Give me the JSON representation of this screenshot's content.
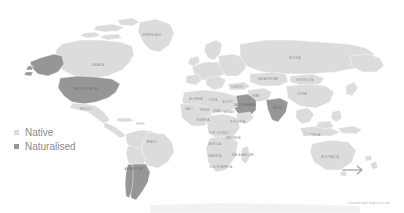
{
  "figure": {
    "type": "choropleth-world-map",
    "background_color": "#ffffff"
  },
  "legend": {
    "items": [
      {
        "label": "Native",
        "color": "#dcdcdc",
        "category": "native"
      },
      {
        "label": "Naturalised",
        "color": "#969696",
        "category": "naturalised"
      }
    ]
  },
  "attribution": {
    "text": "Created with mapchart.net"
  },
  "annotations": [
    {
      "name": "new-zealand-arrow",
      "type": "arrow",
      "direction": "right"
    }
  ],
  "chart_data": {
    "type": "map",
    "title": "",
    "legend_position": "left",
    "categories": [
      "Native",
      "Naturalised"
    ],
    "colors": {
      "Native": "#dcdcdc",
      "Naturalised": "#969696",
      "background": "#ffffff"
    },
    "regions": [
      {
        "name": "Alaska",
        "category": "Naturalised"
      },
      {
        "name": "United States",
        "category": "Naturalised"
      },
      {
        "name": "Canada",
        "category": "Native"
      },
      {
        "name": "Greenland",
        "category": "Native"
      },
      {
        "name": "Mexico",
        "category": "Native"
      },
      {
        "name": "Brazil",
        "category": "Native"
      },
      {
        "name": "Argentina",
        "category": "Naturalised"
      },
      {
        "name": "Chile",
        "category": "Naturalised"
      },
      {
        "name": "Europe",
        "category": "Native"
      },
      {
        "name": "Africa",
        "category": "Native"
      },
      {
        "name": "Saudi Arabia",
        "category": "Naturalised"
      },
      {
        "name": "Yemen",
        "category": "Naturalised"
      },
      {
        "name": "Oman",
        "category": "Naturalised"
      },
      {
        "name": "Russia",
        "category": "Native"
      },
      {
        "name": "Mongolia",
        "category": "Native"
      },
      {
        "name": "China",
        "category": "Native"
      },
      {
        "name": "India",
        "category": "Naturalised"
      },
      {
        "name": "Indonesia",
        "category": "Native"
      },
      {
        "name": "Australia",
        "category": "Native"
      }
    ]
  },
  "map_labels": [
    {
      "text": "GREENLAND",
      "x": 152,
      "y": 36,
      "dark": false
    },
    {
      "text": "CANADA",
      "x": 98,
      "y": 66,
      "dark": false
    },
    {
      "text": "UNITED STATES",
      "x": 86,
      "y": 90,
      "dark": true
    },
    {
      "text": "MEXICO",
      "x": 86,
      "y": 110,
      "dark": false
    },
    {
      "text": "BRAZIL",
      "x": 152,
      "y": 143,
      "dark": false
    },
    {
      "text": "ARGENTINA",
      "x": 134,
      "y": 170,
      "dark": true
    },
    {
      "text": "ALGERIA",
      "x": 196,
      "y": 100,
      "dark": false
    },
    {
      "text": "LIBYA",
      "x": 213,
      "y": 101,
      "dark": false
    },
    {
      "text": "EGYPT",
      "x": 228,
      "y": 103,
      "dark": false
    },
    {
      "text": "MALI",
      "x": 189,
      "y": 110,
      "dark": false
    },
    {
      "text": "NIGER",
      "x": 205,
      "y": 111,
      "dark": false
    },
    {
      "text": "CHAD",
      "x": 217,
      "y": 112,
      "dark": false
    },
    {
      "text": "SUDAN",
      "x": 229,
      "y": 113,
      "dark": false
    },
    {
      "text": "NIGERIA",
      "x": 203,
      "y": 121,
      "dark": false
    },
    {
      "text": "ETHIOPIA",
      "x": 238,
      "y": 123,
      "dark": false
    },
    {
      "text": "D.R. CONGO",
      "x": 219,
      "y": 134,
      "dark": false
    },
    {
      "text": "TANZANIA",
      "x": 233,
      "y": 139,
      "dark": false
    },
    {
      "text": "ANGOLA",
      "x": 215,
      "y": 145,
      "dark": false
    },
    {
      "text": "NAMIBIA",
      "x": 215,
      "y": 157,
      "dark": false
    },
    {
      "text": "SOUTH AFRICA",
      "x": 221,
      "y": 168,
      "dark": false
    },
    {
      "text": "MADAGASCAR",
      "x": 243,
      "y": 156,
      "dark": false
    },
    {
      "text": "SAUDI ARABIA",
      "x": 245,
      "y": 106,
      "dark": true
    },
    {
      "text": "IRAN",
      "x": 256,
      "y": 97,
      "dark": false
    },
    {
      "text": "TURKEY",
      "x": 237,
      "y": 88,
      "dark": false
    },
    {
      "text": "RUSSIA",
      "x": 295,
      "y": 59,
      "dark": false
    },
    {
      "text": "KAZAKHSTAN",
      "x": 268,
      "y": 80,
      "dark": false
    },
    {
      "text": "MONGOLIA",
      "x": 305,
      "y": 81,
      "dark": false
    },
    {
      "text": "CHINA",
      "x": 302,
      "y": 95,
      "dark": false
    },
    {
      "text": "INDIA",
      "x": 277,
      "y": 109,
      "dark": true
    },
    {
      "text": "INDONESIA",
      "x": 312,
      "y": 136,
      "dark": false
    },
    {
      "text": "AUSTRALIA",
      "x": 330,
      "y": 158,
      "dark": false
    }
  ]
}
